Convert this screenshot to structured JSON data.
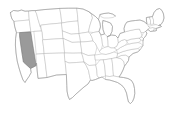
{
  "map": {
    "title": "United States map",
    "subject": "us-states-choropleth",
    "background_color": "#ffffff",
    "default_state_fill": "#ffffff",
    "state_border_color": "#b4b4b4",
    "outline_color": "#8f8f8f",
    "highlight_fill": "#9a9a9a",
    "highlight_border_color": "#6e6e6e",
    "highlighted_states": [
      "Nevada"
    ],
    "region": "Contiguous United States (lower 48)",
    "legend_visible": false,
    "labels_visible": false,
    "states": [
      {
        "code": "WA",
        "name": "Washington",
        "highlighted": false
      },
      {
        "code": "OR",
        "name": "Oregon",
        "highlighted": false
      },
      {
        "code": "CA",
        "name": "California",
        "highlighted": false
      },
      {
        "code": "NV",
        "name": "Nevada",
        "highlighted": true
      },
      {
        "code": "ID",
        "name": "Idaho",
        "highlighted": false
      },
      {
        "code": "MT",
        "name": "Montana",
        "highlighted": false
      },
      {
        "code": "WY",
        "name": "Wyoming",
        "highlighted": false
      },
      {
        "code": "UT",
        "name": "Utah",
        "highlighted": false
      },
      {
        "code": "AZ",
        "name": "Arizona",
        "highlighted": false
      },
      {
        "code": "CO",
        "name": "Colorado",
        "highlighted": false
      },
      {
        "code": "NM",
        "name": "New Mexico",
        "highlighted": false
      },
      {
        "code": "ND",
        "name": "North Dakota",
        "highlighted": false
      },
      {
        "code": "SD",
        "name": "South Dakota",
        "highlighted": false
      },
      {
        "code": "NE",
        "name": "Nebraska",
        "highlighted": false
      },
      {
        "code": "KS",
        "name": "Kansas",
        "highlighted": false
      },
      {
        "code": "OK",
        "name": "Oklahoma",
        "highlighted": false
      },
      {
        "code": "TX",
        "name": "Texas",
        "highlighted": false
      },
      {
        "code": "MN",
        "name": "Minnesota",
        "highlighted": false
      },
      {
        "code": "IA",
        "name": "Iowa",
        "highlighted": false
      },
      {
        "code": "MO",
        "name": "Missouri",
        "highlighted": false
      },
      {
        "code": "AR",
        "name": "Arkansas",
        "highlighted": false
      },
      {
        "code": "LA",
        "name": "Louisiana",
        "highlighted": false
      },
      {
        "code": "WI",
        "name": "Wisconsin",
        "highlighted": false
      },
      {
        "code": "IL",
        "name": "Illinois",
        "highlighted": false
      },
      {
        "code": "MI",
        "name": "Michigan",
        "highlighted": false
      },
      {
        "code": "IN",
        "name": "Indiana",
        "highlighted": false
      },
      {
        "code": "OH",
        "name": "Ohio",
        "highlighted": false
      },
      {
        "code": "KY",
        "name": "Kentucky",
        "highlighted": false
      },
      {
        "code": "TN",
        "name": "Tennessee",
        "highlighted": false
      },
      {
        "code": "MS",
        "name": "Mississippi",
        "highlighted": false
      },
      {
        "code": "AL",
        "name": "Alabama",
        "highlighted": false
      },
      {
        "code": "GA",
        "name": "Georgia",
        "highlighted": false
      },
      {
        "code": "FL",
        "name": "Florida",
        "highlighted": false
      },
      {
        "code": "SC",
        "name": "South Carolina",
        "highlighted": false
      },
      {
        "code": "NC",
        "name": "North Carolina",
        "highlighted": false
      },
      {
        "code": "VA",
        "name": "Virginia",
        "highlighted": false
      },
      {
        "code": "WV",
        "name": "West Virginia",
        "highlighted": false
      },
      {
        "code": "MD",
        "name": "Maryland",
        "highlighted": false
      },
      {
        "code": "DE",
        "name": "Delaware",
        "highlighted": false
      },
      {
        "code": "PA",
        "name": "Pennsylvania",
        "highlighted": false
      },
      {
        "code": "NJ",
        "name": "New Jersey",
        "highlighted": false
      },
      {
        "code": "NY",
        "name": "New York",
        "highlighted": false
      },
      {
        "code": "CT",
        "name": "Connecticut",
        "highlighted": false
      },
      {
        "code": "RI",
        "name": "Rhode Island",
        "highlighted": false
      },
      {
        "code": "MA",
        "name": "Massachusetts",
        "highlighted": false
      },
      {
        "code": "VT",
        "name": "Vermont",
        "highlighted": false
      },
      {
        "code": "NH",
        "name": "New Hampshire",
        "highlighted": false
      },
      {
        "code": "ME",
        "name": "Maine",
        "highlighted": false
      }
    ]
  }
}
